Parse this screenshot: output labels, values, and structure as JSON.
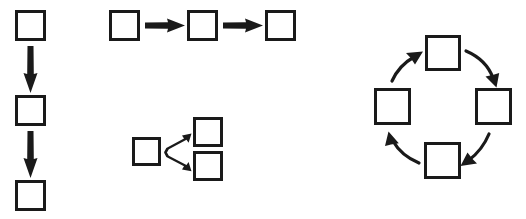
{
  "figure": {
    "title": "",
    "background_color": "#ffffff",
    "stroke_color": "#1a1a1a",
    "fill_color": "#ffffff",
    "width": 526,
    "height": 219
  },
  "chart_data": {
    "type": "diagram",
    "title": "",
    "groups": [
      {
        "id": "vertical-chain",
        "label": "Vertical chain",
        "layout": "vertical-sequence",
        "node_count": 3,
        "arrow_count": 2,
        "arrow_style": "straight",
        "direction": "down",
        "nodes": [
          {
            "id": "v1",
            "x": 16,
            "y": 11,
            "w": 29,
            "h": 29,
            "label": ""
          },
          {
            "id": "v2",
            "x": 16,
            "y": 96,
            "w": 29,
            "h": 29,
            "label": ""
          },
          {
            "id": "v3",
            "x": 16,
            "y": 181,
            "w": 29,
            "h": 29,
            "label": ""
          }
        ],
        "arrows": [
          {
            "from": "v1",
            "to": "v2",
            "label": ""
          },
          {
            "from": "v2",
            "to": "v3",
            "label": ""
          }
        ]
      },
      {
        "id": "horizontal-chain",
        "label": "Horizontal chain",
        "layout": "horizontal-sequence",
        "node_count": 3,
        "arrow_count": 2,
        "arrow_style": "straight",
        "direction": "right",
        "nodes": [
          {
            "id": "h1",
            "x": 110,
            "y": 11,
            "w": 29,
            "h": 29,
            "label": ""
          },
          {
            "id": "h2",
            "x": 188,
            "y": 11,
            "w": 29,
            "h": 29,
            "label": ""
          },
          {
            "id": "h3",
            "x": 266,
            "y": 11,
            "w": 29,
            "h": 29,
            "label": ""
          }
        ],
        "arrows": [
          {
            "from": "h1",
            "to": "h2",
            "label": ""
          },
          {
            "from": "h2",
            "to": "h3",
            "label": ""
          }
        ]
      },
      {
        "id": "branch-split",
        "label": "Branching split",
        "layout": "one-to-two-branch",
        "node_count": 3,
        "arrow_count": 2,
        "arrow_style": "straight-diagonal",
        "direction": "right-fork",
        "nodes": [
          {
            "id": "b1",
            "x": 133,
            "y": 138,
            "w": 27,
            "h": 27,
            "label": ""
          },
          {
            "id": "b2",
            "x": 194,
            "y": 118,
            "w": 28,
            "h": 28,
            "label": ""
          },
          {
            "id": "b3",
            "x": 194,
            "y": 152,
            "w": 28,
            "h": 28,
            "label": ""
          }
        ],
        "arrows": [
          {
            "from": "b1",
            "to": "b2",
            "label": ""
          },
          {
            "from": "b1",
            "to": "b3",
            "label": ""
          }
        ]
      },
      {
        "id": "cycle",
        "label": "Clockwise cycle",
        "layout": "circular",
        "node_count": 4,
        "arrow_count": 4,
        "arrow_style": "curved",
        "direction": "clockwise",
        "nodes": [
          {
            "id": "c-top",
            "x": 426,
            "y": 36,
            "w": 34,
            "h": 34,
            "label": ""
          },
          {
            "id": "c-right",
            "x": 476,
            "y": 89,
            "w": 35,
            "h": 35,
            "label": ""
          },
          {
            "id": "c-bottom",
            "x": 425,
            "y": 143,
            "w": 35,
            "h": 35,
            "label": ""
          },
          {
            "id": "c-left",
            "x": 375,
            "y": 89,
            "w": 35,
            "h": 35,
            "label": ""
          }
        ],
        "arrows": [
          {
            "from": "c-top",
            "to": "c-right",
            "label": ""
          },
          {
            "from": "c-right",
            "to": "c-bottom",
            "label": ""
          },
          {
            "from": "c-bottom",
            "to": "c-left",
            "label": ""
          },
          {
            "from": "c-left",
            "to": "c-top",
            "label": ""
          }
        ]
      }
    ]
  }
}
